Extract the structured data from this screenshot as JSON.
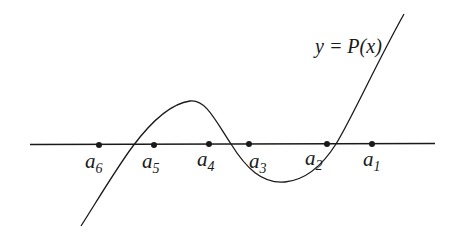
{
  "diagram": {
    "type": "polynomial-graph",
    "function_label": "y = P(x)",
    "colors": {
      "stroke": "#1a1a1a",
      "background": "#ffffff"
    },
    "axis": {
      "x1": 30,
      "y1": 144.5,
      "x2": 435,
      "y2": 143.5
    },
    "curve_path": "M 81 226 C 100 196, 118 166, 133 146 C 148 126, 168 104, 190 101 C 205 99, 214 118, 231 144 C 246 168, 262 184, 285 182 C 306 180, 322 166, 336 144 C 352 118, 375 66, 404 14",
    "points": [
      {
        "id": "a6",
        "base": "a",
        "sub": "6",
        "cx": 99,
        "cy": 145,
        "lx": 85,
        "ly": 151
      },
      {
        "id": "a5",
        "base": "a",
        "sub": "5",
        "cx": 154,
        "cy": 145,
        "lx": 142,
        "ly": 151
      },
      {
        "id": "a4",
        "base": "a",
        "sub": "4",
        "cx": 209,
        "cy": 144,
        "lx": 197,
        "ly": 149
      },
      {
        "id": "a3",
        "base": "a",
        "sub": "3",
        "cx": 249,
        "cy": 144,
        "lx": 249,
        "ly": 151
      },
      {
        "id": "a2",
        "base": "a",
        "sub": "2",
        "cx": 327,
        "cy": 144,
        "lx": 305,
        "ly": 148
      },
      {
        "id": "a1",
        "base": "a",
        "sub": "1",
        "cx": 372,
        "cy": 144,
        "lx": 363,
        "ly": 149
      }
    ],
    "function_label_pos": {
      "x": 315,
      "y": 36
    }
  }
}
